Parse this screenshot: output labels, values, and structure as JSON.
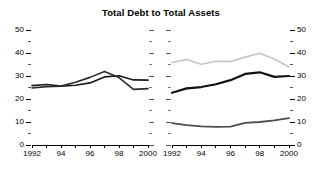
{
  "chart_data": {
    "type": "line",
    "title": "Total Debt to Total Assets",
    "xlabel": "",
    "ylabel": "",
    "grid": false,
    "legend": "none",
    "panels": [
      {
        "name": "left-panel",
        "axis_side": "left",
        "x": [
          1992,
          1993,
          1994,
          1995,
          1996,
          1997,
          1998,
          1999,
          2000
        ],
        "xlim": [
          1992,
          2000
        ],
        "ylim": [
          0,
          50
        ],
        "ytick_values": [
          0,
          10,
          20,
          30,
          40,
          50
        ],
        "ytick_labels": [
          "0",
          "10",
          "20",
          "30",
          "40",
          "50"
        ],
        "yminor_values": [
          5,
          15,
          25,
          35,
          45
        ],
        "xtick_values": [
          1992,
          1993,
          1994,
          1995,
          1996,
          1997,
          1998,
          1999,
          2000
        ],
        "xtick_labels": [
          "1992",
          "",
          "94",
          "",
          "96",
          "",
          "98",
          "",
          "2000"
        ],
        "series": [
          {
            "name": "series-a",
            "color": "#1a1a1a",
            "width": 1.6,
            "values": [
              25.8,
              26.3,
              25.6,
              26.0,
              27.0,
              29.6,
              30.1,
              28.3,
              28.2
            ]
          },
          {
            "name": "series-b",
            "color": "#2b2b2b",
            "width": 1.6,
            "values": [
              24.8,
              25.4,
              25.6,
              27.3,
              29.4,
              32.0,
              29.3,
              24.2,
              24.5
            ]
          }
        ]
      },
      {
        "name": "right-panel",
        "axis_side": "right",
        "x": [
          1992,
          1993,
          1994,
          1995,
          1996,
          1997,
          1998,
          1999,
          2000
        ],
        "xlim": [
          1992,
          2000
        ],
        "ylim": [
          0,
          50
        ],
        "ytick_values": [
          0,
          10,
          20,
          30,
          40,
          50
        ],
        "ytick_labels": [
          "0",
          "10",
          "20",
          "30",
          "40",
          "50"
        ],
        "yminor_values": [
          5,
          15,
          25,
          35,
          45
        ],
        "xtick_values": [
          1992,
          1993,
          1994,
          1995,
          1996,
          1997,
          1998,
          1999,
          2000
        ],
        "xtick_labels": [
          "1992",
          "",
          "94",
          "",
          "96",
          "",
          "98",
          "",
          "2000"
        ],
        "series": [
          {
            "name": "series-c",
            "color": "#c4c4c4",
            "width": 1.6,
            "values": [
              35.9,
              37.2,
              35.1,
              36.4,
              36.3,
              38.2,
              39.9,
              37.4,
              33.9
            ]
          },
          {
            "name": "series-d",
            "color": "#111111",
            "width": 2.2,
            "values": [
              22.7,
              24.6,
              25.2,
              26.4,
              28.2,
              30.9,
              31.6,
              29.6,
              30.0
            ]
          },
          {
            "name": "series-e",
            "color": "#4d4d4d",
            "width": 1.8,
            "values": [
              9.5,
              8.6,
              8.1,
              7.9,
              8.0,
              9.6,
              10.0,
              10.7,
              11.7
            ]
          }
        ]
      }
    ]
  }
}
